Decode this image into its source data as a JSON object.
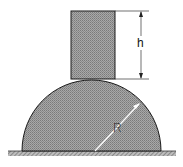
{
  "figure": {
    "labels": {
      "height": "h",
      "radius": "R"
    },
    "colors": {
      "fill_gray": "#9a9a9a",
      "outline": "#1a1a1a",
      "background": "#ffffff",
      "radius_line": "#ffffff"
    },
    "elements": {
      "block": "rectangular block resting on top of hemisphere",
      "hemisphere": "solid hemisphere of radius R on flat ground",
      "ground": "hatched flat surface"
    }
  }
}
